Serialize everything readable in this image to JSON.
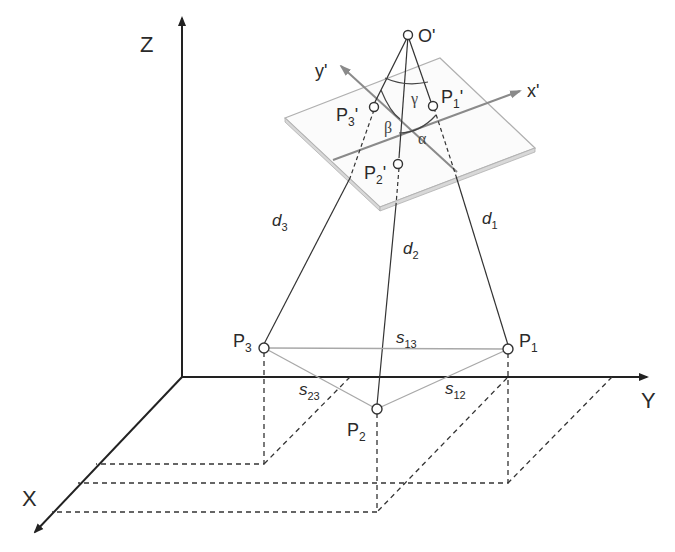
{
  "diagram": {
    "type": "3D camera space resection geometry",
    "axes": {
      "world": {
        "x": "X",
        "y": "Y",
        "z": "Z"
      },
      "image": {
        "x": "x'",
        "y": "y'"
      }
    },
    "projection_center": {
      "label": "O'"
    },
    "image_points": [
      {
        "id": "P1p",
        "base": "P",
        "sub": "1",
        "prime": "'"
      },
      {
        "id": "P2p",
        "base": "P",
        "sub": "2",
        "prime": "'"
      },
      {
        "id": "P3p",
        "base": "P",
        "sub": "3",
        "prime": "'"
      }
    ],
    "object_points": [
      {
        "id": "P1",
        "base": "P",
        "sub": "1"
      },
      {
        "id": "P2",
        "base": "P",
        "sub": "2"
      },
      {
        "id": "P3",
        "base": "P",
        "sub": "3"
      }
    ],
    "distances": [
      {
        "id": "d1",
        "base": "d",
        "sub": "1"
      },
      {
        "id": "d2",
        "base": "d",
        "sub": "2"
      },
      {
        "id": "d3",
        "base": "d",
        "sub": "3"
      }
    ],
    "sides": [
      {
        "id": "s12",
        "base": "s",
        "sub": "12"
      },
      {
        "id": "s13",
        "base": "s",
        "sub": "13"
      },
      {
        "id": "s23",
        "base": "s",
        "sub": "23"
      }
    ],
    "angles": {
      "alpha": "α",
      "beta": "β",
      "gamma": "γ"
    },
    "colors": {
      "axis": "#222222",
      "image_axis": "#8a8a8a",
      "plane": "#b0b0b0",
      "side": "#a8a8a8",
      "ray": "#333333"
    }
  }
}
